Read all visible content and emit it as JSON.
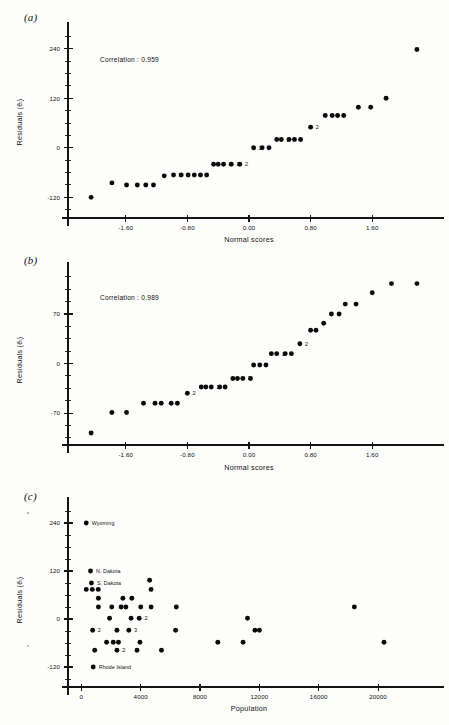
{
  "figure": {
    "panels": [
      {
        "letter": "(a)",
        "annotation": "Correlation : 0.959",
        "ylabel": "Residuals (êᵢ)",
        "xlabel": "Normal scores"
      },
      {
        "letter": "(b)",
        "annotation": "Correlation : 0.989",
        "ylabel": "Residuals (êᵢ)",
        "xlabel": "Normal scores"
      },
      {
        "letter": "(c)",
        "annotation": "",
        "ylabel": "Residuals (êᵢ)",
        "xlabel": "Population"
      }
    ]
  },
  "chart_data": [
    {
      "id": "panel-a",
      "type": "scatter",
      "title": "(a)",
      "xlabel": "Normal scores",
      "ylabel": "Residuals (êᵢ)",
      "annotations": [
        "Correlation : 0.959"
      ],
      "correlation": 0.959,
      "grid": false,
      "legend": null,
      "xlim": [
        -2.35,
        2.35
      ],
      "ylim": [
        -170,
        290
      ],
      "xticks": [
        -1.6,
        -0.8,
        0.0,
        0.8,
        1.6
      ],
      "xticklabels": [
        "-1.60",
        "-0.80",
        "0.00",
        "0.80",
        "1.60"
      ],
      "yticks": [
        -120,
        0,
        120,
        240
      ],
      "yticklabels": [
        "-120",
        "0",
        "120",
        "240"
      ],
      "yminorstep": 30,
      "points": [
        {
          "x": -2.05,
          "y": -120,
          "n": 1
        },
        {
          "x": -1.78,
          "y": -85,
          "n": 1
        },
        {
          "x": -1.59,
          "y": -90,
          "n": 1
        },
        {
          "x": -1.45,
          "y": -90,
          "n": 1
        },
        {
          "x": -1.34,
          "y": -90,
          "n": 1
        },
        {
          "x": -1.24,
          "y": -90,
          "n": 1
        },
        {
          "x": -1.1,
          "y": -68,
          "n": 1
        },
        {
          "x": -0.98,
          "y": -66,
          "n": 2,
          "label": "2"
        },
        {
          "x": -0.88,
          "y": -66,
          "n": 1
        },
        {
          "x": -0.79,
          "y": -66,
          "n": 1
        },
        {
          "x": -0.71,
          "y": -66,
          "n": 1
        },
        {
          "x": -0.63,
          "y": -66,
          "n": 1
        },
        {
          "x": -0.55,
          "y": -66,
          "n": 1
        },
        {
          "x": -0.46,
          "y": -40,
          "n": 1
        },
        {
          "x": -0.4,
          "y": -40,
          "n": 1
        },
        {
          "x": -0.33,
          "y": -40,
          "n": 2,
          "label": "2"
        },
        {
          "x": -0.23,
          "y": -40,
          "n": 2,
          "label": "2"
        },
        {
          "x": -0.12,
          "y": -40,
          "n": 2,
          "label": "2"
        },
        {
          "x": 0.06,
          "y": 0,
          "n": 2,
          "label": "2"
        },
        {
          "x": 0.17,
          "y": 0,
          "n": 1
        },
        {
          "x": 0.26,
          "y": 0,
          "n": 1
        },
        {
          "x": 0.36,
          "y": 20,
          "n": 1
        },
        {
          "x": 0.42,
          "y": 20,
          "n": 2,
          "label": "2"
        },
        {
          "x": 0.52,
          "y": 20,
          "n": 1
        },
        {
          "x": 0.59,
          "y": 20,
          "n": 1
        },
        {
          "x": 0.67,
          "y": 20,
          "n": 1
        },
        {
          "x": 0.8,
          "y": 50,
          "n": 2,
          "label": "2"
        },
        {
          "x": 0.99,
          "y": 78,
          "n": 1
        },
        {
          "x": 1.08,
          "y": 78,
          "n": 1
        },
        {
          "x": 1.15,
          "y": 78,
          "n": 1
        },
        {
          "x": 1.23,
          "y": 78,
          "n": 1
        },
        {
          "x": 1.42,
          "y": 98,
          "n": 1
        },
        {
          "x": 1.58,
          "y": 98,
          "n": 1
        },
        {
          "x": 1.78,
          "y": 120,
          "n": 1
        },
        {
          "x": 2.18,
          "y": 238,
          "n": 1
        }
      ]
    },
    {
      "id": "panel-b",
      "type": "scatter",
      "title": "(b)",
      "xlabel": "Normal scores",
      "ylabel": "Residuals (êᵢ)",
      "annotations": [
        "Correlation : 0.989"
      ],
      "correlation": 0.989,
      "grid": false,
      "legend": null,
      "xlim": [
        -2.35,
        2.35
      ],
      "ylim": [
        -115,
        135
      ],
      "xticks": [
        -1.6,
        -0.8,
        0.0,
        0.8,
        1.6
      ],
      "xticklabels": [
        "-1.60",
        "-0.80",
        "0.00",
        "0.80",
        "1.60"
      ],
      "yticks": [
        -70,
        0,
        70
      ],
      "yticklabels": [
        "-70",
        "0",
        "70"
      ],
      "yminorstep": 17.5,
      "points": [
        {
          "x": -2.05,
          "y": -98,
          "n": 1
        },
        {
          "x": -1.78,
          "y": -69,
          "n": 1
        },
        {
          "x": -1.59,
          "y": -69,
          "n": 1
        },
        {
          "x": -1.37,
          "y": -56,
          "n": 1
        },
        {
          "x": -1.22,
          "y": -56,
          "n": 1
        },
        {
          "x": -1.14,
          "y": -56,
          "n": 1
        },
        {
          "x": -1.01,
          "y": -56,
          "n": 1
        },
        {
          "x": -0.93,
          "y": -56,
          "n": 1
        },
        {
          "x": -0.8,
          "y": -42,
          "n": 2,
          "label": "2"
        },
        {
          "x": -0.62,
          "y": -33,
          "n": 1
        },
        {
          "x": -0.56,
          "y": -33,
          "n": 1
        },
        {
          "x": -0.49,
          "y": -33,
          "n": 2,
          "label": "2"
        },
        {
          "x": -0.38,
          "y": -33,
          "n": 1
        },
        {
          "x": -0.31,
          "y": -33,
          "n": 1
        },
        {
          "x": -0.21,
          "y": -21,
          "n": 1
        },
        {
          "x": -0.15,
          "y": -21,
          "n": 1
        },
        {
          "x": -0.08,
          "y": -21,
          "n": 2,
          "label": "2"
        },
        {
          "x": 0.02,
          "y": -21,
          "n": 1
        },
        {
          "x": 0.06,
          "y": -2,
          "n": 1
        },
        {
          "x": 0.14,
          "y": -2,
          "n": 1
        },
        {
          "x": 0.22,
          "y": -2,
          "n": 1
        },
        {
          "x": 0.29,
          "y": 14,
          "n": 1
        },
        {
          "x": 0.36,
          "y": 14,
          "n": 2,
          "label": "2"
        },
        {
          "x": 0.47,
          "y": 14,
          "n": 1
        },
        {
          "x": 0.55,
          "y": 14,
          "n": 1
        },
        {
          "x": 0.66,
          "y": 28,
          "n": 2,
          "label": "2"
        },
        {
          "x": 0.8,
          "y": 47,
          "n": 1
        },
        {
          "x": 0.87,
          "y": 47,
          "n": 1
        },
        {
          "x": 0.97,
          "y": 57,
          "n": 1
        },
        {
          "x": 1.07,
          "y": 70,
          "n": 1
        },
        {
          "x": 1.17,
          "y": 70,
          "n": 1
        },
        {
          "x": 1.25,
          "y": 84,
          "n": 1
        },
        {
          "x": 1.39,
          "y": 84,
          "n": 1
        },
        {
          "x": 1.6,
          "y": 100,
          "n": 1
        },
        {
          "x": 1.85,
          "y": 113,
          "n": 1
        },
        {
          "x": 2.18,
          "y": 113,
          "n": 1
        }
      ]
    },
    {
      "id": "panel-c",
      "type": "scatter",
      "title": "(c)",
      "xlabel": "Population",
      "ylabel": "Residuals (êᵢ)",
      "annotations": [],
      "grid": false,
      "legend": null,
      "xlim": [
        -900,
        23500
      ],
      "ylim": [
        -170,
        290
      ],
      "xticks": [
        0,
        4000,
        8000,
        12000,
        16000,
        20000
      ],
      "xticklabels": [
        "0",
        "4000",
        "8000",
        "12000",
        "16000",
        "20000"
      ],
      "yticks": [
        -120,
        0,
        120,
        240
      ],
      "yticklabels": [
        "-120",
        "0",
        "120",
        "240"
      ],
      "yminorstep": 30,
      "points": [
        {
          "x": 330,
          "y": 240,
          "n": 1,
          "state": "Wyoming"
        },
        {
          "x": 620,
          "y": 120,
          "n": 1,
          "state": "N. Dakota"
        },
        {
          "x": 680,
          "y": 90,
          "n": 1,
          "state": "S. Dakota"
        },
        {
          "x": 330,
          "y": 74,
          "n": 1
        },
        {
          "x": 740,
          "y": 74,
          "n": 1
        },
        {
          "x": 1140,
          "y": 74,
          "n": 1
        },
        {
          "x": 1150,
          "y": 52,
          "n": 1
        },
        {
          "x": 1150,
          "y": 30,
          "n": 1
        },
        {
          "x": 2050,
          "y": 30,
          "n": 1
        },
        {
          "x": 2680,
          "y": 30,
          "n": 1
        },
        {
          "x": 3000,
          "y": 30,
          "n": 1
        },
        {
          "x": 2800,
          "y": 52,
          "n": 1
        },
        {
          "x": 3400,
          "y": 52,
          "n": 1
        },
        {
          "x": 4000,
          "y": 30,
          "n": 1
        },
        {
          "x": 4600,
          "y": 97,
          "n": 1
        },
        {
          "x": 4700,
          "y": 74,
          "n": 1
        },
        {
          "x": 4700,
          "y": 30,
          "n": 1
        },
        {
          "x": 6400,
          "y": 30,
          "n": 1
        },
        {
          "x": 1900,
          "y": 2,
          "n": 1
        },
        {
          "x": 3350,
          "y": 2,
          "n": 1
        },
        {
          "x": 3900,
          "y": 2,
          "n": 2,
          "label": "2"
        },
        {
          "x": 760,
          "y": -28,
          "n": 2,
          "label": "2"
        },
        {
          "x": 2400,
          "y": -28,
          "n": 1
        },
        {
          "x": 3200,
          "y": -28,
          "n": 3,
          "label": "3"
        },
        {
          "x": 6350,
          "y": -28,
          "n": 1
        },
        {
          "x": 11200,
          "y": 2,
          "n": 1
        },
        {
          "x": 11700,
          "y": -28,
          "n": 1
        },
        {
          "x": 12000,
          "y": -28,
          "n": 1
        },
        {
          "x": 18400,
          "y": 30,
          "n": 1
        },
        {
          "x": 1700,
          "y": -58,
          "n": 2,
          "label": "2"
        },
        {
          "x": 2150,
          "y": -58,
          "n": 1
        },
        {
          "x": 2500,
          "y": -58,
          "n": 1
        },
        {
          "x": 3950,
          "y": -58,
          "n": 1
        },
        {
          "x": 9200,
          "y": -58,
          "n": 1
        },
        {
          "x": 10900,
          "y": -58,
          "n": 1
        },
        {
          "x": 20400,
          "y": -58,
          "n": 1
        },
        {
          "x": 900,
          "y": -78,
          "n": 1
        },
        {
          "x": 2400,
          "y": -78,
          "n": 2,
          "label": "2"
        },
        {
          "x": 3750,
          "y": -78,
          "n": 1
        },
        {
          "x": 5400,
          "y": -78,
          "n": 1
        },
        {
          "x": 800,
          "y": -120,
          "n": 1,
          "state": "Rhode Island"
        }
      ]
    }
  ]
}
